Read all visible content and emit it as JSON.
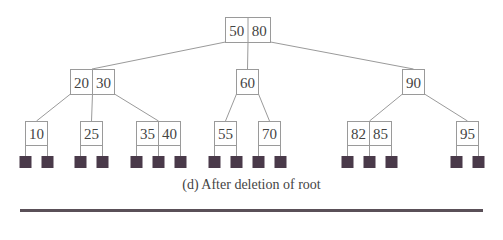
{
  "caption": "(d) After deletion of root",
  "colors": {
    "node_border": "#9a9a9a",
    "edge": "#9a9a9a",
    "leaf_square": "#4a3a4a",
    "text": "#444444",
    "rule": "#5a5058"
  },
  "tree": {
    "root": {
      "keys": [
        "50",
        "80"
      ],
      "x": 225,
      "y": 17,
      "w": 45,
      "h": 25
    },
    "level1": [
      {
        "id": "n2030",
        "keys": [
          "20",
          "30"
        ],
        "x": 70,
        "y": 69,
        "w": 44,
        "h": 25
      },
      {
        "id": "n60",
        "keys": [
          "60"
        ],
        "x": 236,
        "y": 69,
        "w": 22,
        "h": 25
      },
      {
        "id": "n90",
        "keys": [
          "90"
        ],
        "x": 402,
        "y": 69,
        "w": 22,
        "h": 25
      }
    ],
    "leaves": [
      {
        "id": "l10",
        "parent": 0,
        "slot": 0,
        "keys": [
          "10"
        ],
        "x": 25
      },
      {
        "id": "l25",
        "parent": 0,
        "slot": 1,
        "keys": [
          "25"
        ],
        "x": 80
      },
      {
        "id": "l3540",
        "parent": 0,
        "slot": 2,
        "keys": [
          "35",
          "40"
        ],
        "x": 136
      },
      {
        "id": "l55",
        "parent": 1,
        "slot": 0,
        "keys": [
          "55"
        ],
        "x": 214
      },
      {
        "id": "l70",
        "parent": 1,
        "slot": 1,
        "keys": [
          "70"
        ],
        "x": 258
      },
      {
        "id": "l8285",
        "parent": 2,
        "slot": 0,
        "keys": [
          "82",
          "85"
        ],
        "x": 347
      },
      {
        "id": "l95",
        "parent": 2,
        "slot": 1,
        "keys": [
          "95"
        ],
        "x": 456
      }
    ]
  }
}
